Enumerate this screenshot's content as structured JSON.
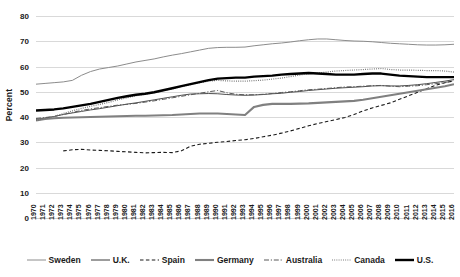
{
  "chart_data": {
    "type": "line",
    "title": "",
    "xlabel": "",
    "ylabel": "Percent",
    "ylim": [
      0,
      80
    ],
    "ytick_step": 10,
    "yticks": [
      0,
      10,
      20,
      30,
      40,
      50,
      60,
      70,
      80
    ],
    "grid": true,
    "legend_position": "bottom",
    "x": [
      1970,
      1971,
      1972,
      1973,
      1974,
      1975,
      1976,
      1977,
      1978,
      1979,
      1980,
      1981,
      1982,
      1983,
      1984,
      1985,
      1986,
      1987,
      1988,
      1989,
      1990,
      1991,
      1992,
      1993,
      1994,
      1995,
      1996,
      1997,
      1998,
      1999,
      2000,
      2001,
      2002,
      2003,
      2004,
      2005,
      2006,
      2007,
      2008,
      2009,
      2010,
      2011,
      2012,
      2013,
      2014,
      2015,
      2016
    ],
    "series": [
      {
        "name": "Sweden",
        "style": "solid",
        "color": "#8c8c8c",
        "width": 1.0,
        "values": [
          53.0,
          53.3,
          53.6,
          53.9,
          54.5,
          56.5,
          58.0,
          59.0,
          59.6,
          60.2,
          61.0,
          61.8,
          62.4,
          63.0,
          63.8,
          64.5,
          65.1,
          65.8,
          66.5,
          67.2,
          67.5,
          67.6,
          67.6,
          67.7,
          68.2,
          68.6,
          69.0,
          69.3,
          69.7,
          70.2,
          70.6,
          70.9,
          70.9,
          70.6,
          70.3,
          70.1,
          70.0,
          69.8,
          69.5,
          69.2,
          69.0,
          68.8,
          68.6,
          68.5,
          68.5,
          68.6,
          68.8
        ]
      },
      {
        "name": "U.K.",
        "style": "solid",
        "color": "#3a3a3a",
        "width": 0.9,
        "values": [
          39.0,
          39.6,
          40.2,
          41.0,
          41.6,
          42.2,
          42.8,
          43.3,
          43.9,
          44.5,
          45.1,
          45.6,
          46.2,
          46.8,
          47.4,
          48.0,
          48.6,
          49.1,
          49.2,
          49.3,
          49.2,
          48.9,
          48.7,
          48.6,
          48.7,
          48.9,
          49.2,
          49.4,
          49.8,
          50.1,
          50.5,
          50.8,
          51.1,
          51.4,
          51.6,
          51.8,
          52.0,
          52.3,
          52.4,
          52.3,
          52.3,
          52.5,
          52.8,
          53.2,
          53.7,
          54.2,
          54.8
        ]
      },
      {
        "name": "Spain",
        "style": "dashed",
        "color": "#1a1a1a",
        "width": 1.1,
        "values": [
          null,
          null,
          null,
          26.6,
          27.0,
          27.2,
          26.9,
          26.8,
          26.6,
          26.4,
          26.2,
          26.0,
          25.8,
          25.9,
          26.0,
          25.9,
          26.6,
          28.4,
          29.2,
          29.6,
          30.0,
          30.3,
          30.7,
          31.0,
          31.5,
          32.2,
          32.8,
          33.6,
          34.5,
          35.5,
          36.5,
          37.4,
          38.2,
          39.0,
          39.8,
          41.0,
          42.4,
          43.6,
          44.6,
          45.6,
          47.0,
          48.4,
          49.8,
          51.2,
          52.6,
          53.6,
          54.3
        ]
      },
      {
        "name": "Germany",
        "style": "solid",
        "color": "#808080",
        "width": 2.1,
        "values": [
          38.6,
          39.2,
          39.5,
          39.7,
          39.8,
          39.9,
          40.0,
          40.1,
          40.2,
          40.3,
          40.4,
          40.5,
          40.5,
          40.6,
          40.7,
          40.8,
          41.0,
          41.2,
          41.4,
          41.4,
          41.4,
          41.2,
          41.0,
          40.8,
          44.0,
          44.8,
          45.2,
          45.2,
          45.2,
          45.3,
          45.4,
          45.6,
          45.8,
          46.0,
          46.2,
          46.4,
          46.8,
          47.4,
          48.0,
          48.6,
          49.2,
          49.8,
          50.4,
          51.0,
          51.6,
          52.2,
          53.0
        ]
      },
      {
        "name": "Australia",
        "style": "dashdot",
        "color": "#595959",
        "width": 1.0,
        "values": [
          39.4,
          39.8,
          40.2,
          41.0,
          41.8,
          42.6,
          43.2,
          43.7,
          44.2,
          44.7,
          45.0,
          45.4,
          45.9,
          46.4,
          47.0,
          47.6,
          48.2,
          48.8,
          49.4,
          50.0,
          50.5,
          49.6,
          49.0,
          48.8,
          48.8,
          49.0,
          49.3,
          49.7,
          50.0,
          50.4,
          50.8,
          51.0,
          51.3,
          51.6,
          51.9,
          52.0,
          52.2,
          52.4,
          52.5,
          52.2,
          52.0,
          52.2,
          52.4,
          52.8,
          53.2,
          53.7,
          54.2
        ]
      },
      {
        "name": "Canada",
        "style": "dotted",
        "color": "#6e6e6e",
        "width": 1.2,
        "values": [
          38.6,
          39.4,
          40.2,
          41.4,
          42.4,
          43.4,
          44.2,
          45.0,
          45.8,
          46.8,
          47.6,
          48.4,
          49.0,
          49.6,
          50.4,
          51.2,
          52.0,
          52.8,
          53.6,
          54.2,
          54.5,
          54.3,
          54.2,
          54.2,
          54.4,
          54.6,
          55.0,
          55.4,
          56.0,
          56.6,
          57.2,
          57.4,
          57.8,
          58.2,
          58.4,
          58.6,
          58.8,
          59.0,
          59.2,
          58.8,
          58.6,
          58.6,
          58.5,
          58.4,
          58.4,
          58.2,
          57.8
        ]
      },
      {
        "name": "U.S.",
        "style": "solid",
        "color": "#000000",
        "width": 2.4,
        "values": [
          42.6,
          42.8,
          43.0,
          43.4,
          44.0,
          44.6,
          45.2,
          46.0,
          46.8,
          47.6,
          48.2,
          48.8,
          49.2,
          49.8,
          50.6,
          51.4,
          52.2,
          53.0,
          53.8,
          54.6,
          55.2,
          55.4,
          55.6,
          55.6,
          56.0,
          56.2,
          56.4,
          56.8,
          57.0,
          57.2,
          57.4,
          57.2,
          57.0,
          56.8,
          56.8,
          56.8,
          57.0,
          57.2,
          57.2,
          56.8,
          56.4,
          56.2,
          56.0,
          55.8,
          55.8,
          55.8,
          55.8
        ]
      }
    ]
  },
  "legend": {
    "items": [
      {
        "label": "Sweden"
      },
      {
        "label": "U.K."
      },
      {
        "label": "Spain"
      },
      {
        "label": "Germany"
      },
      {
        "label": "Australia"
      },
      {
        "label": "Canada"
      },
      {
        "label": "U.S."
      }
    ]
  }
}
